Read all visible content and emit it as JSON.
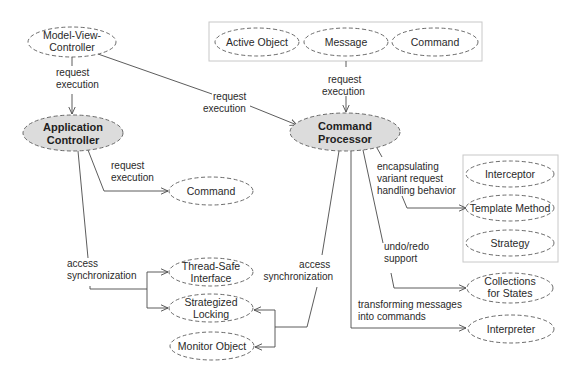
{
  "diagram": {
    "nodes": {
      "mvc": {
        "line1": "Model-View-",
        "line2": "Controller"
      },
      "app_controller": {
        "line1": "Application",
        "line2": "Controller"
      },
      "command_processor": {
        "line1": "Command",
        "line2": "Processor"
      },
      "active_object": {
        "label": "Active Object"
      },
      "message": {
        "label": "Message"
      },
      "command_top": {
        "label": "Command"
      },
      "command_left": {
        "label": "Command"
      },
      "interceptor": {
        "label": "Interceptor"
      },
      "template_method": {
        "label": "Template Method"
      },
      "strategy": {
        "label": "Strategy"
      },
      "collections_for_states": {
        "line1": "Collections",
        "line2": "for States"
      },
      "interpreter": {
        "label": "Interpreter"
      },
      "thread_safe_interface": {
        "line1": "Thread-Safe",
        "line2": "Interface"
      },
      "strategized_locking": {
        "line1": "Strategized",
        "line2": "Locking"
      },
      "monitor_object": {
        "label": "Monitor Object"
      }
    },
    "edges": {
      "mvc_to_app": {
        "line1": "request",
        "line2": "execution"
      },
      "mvc_to_cp": {
        "line1": "request",
        "line2": "execution"
      },
      "top_group_to_cp": {
        "line1": "request",
        "line2": "execution"
      },
      "app_to_command": {
        "line1": "request",
        "line2": "execution"
      },
      "app_sync": {
        "line1": "access",
        "line2": "synchronization"
      },
      "cp_sync": {
        "line1": "access",
        "line2": "synchronization"
      },
      "cp_encapsulating": {
        "line1": "encapsulating",
        "line2": "variant request",
        "line3": "handling behavior"
      },
      "cp_undo": {
        "line1": "undo/redo",
        "line2": "support"
      },
      "cp_transform": {
        "line1": "transforming messages",
        "line2": "into commands"
      }
    },
    "colors": {
      "key_node_fill": "#dcdcdc",
      "node_fill": "#ffffff",
      "stroke": "#5a5a5a",
      "group_box_stroke": "#c8c8c8"
    }
  }
}
